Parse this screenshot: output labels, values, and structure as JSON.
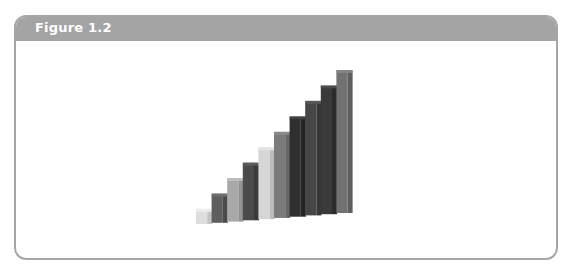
{
  "figure": {
    "title": "Figure 1.2",
    "header_color": "#a4a4a4",
    "border_color": "#a6a6a6"
  },
  "rods": [
    {
      "length": 1,
      "color": "#dedede",
      "side": "#c4c4c4",
      "top": "#ececec"
    },
    {
      "length": 2,
      "color": "#5e5e5e",
      "side": "#4a4a4a",
      "top": "#707070"
    },
    {
      "length": 3,
      "color": "#a9a9a9",
      "side": "#939393",
      "top": "#bcbcbc"
    },
    {
      "length": 4,
      "color": "#4b4b4b",
      "side": "#3a3a3a",
      "top": "#5c5c5c"
    },
    {
      "length": 5,
      "color": "#d6d6d6",
      "side": "#bdbdbd",
      "top": "#e4e4e4"
    },
    {
      "length": 6,
      "color": "#7b7b7b",
      "side": "#666666",
      "top": "#8c8c8c"
    },
    {
      "length": 7,
      "color": "#2f2f2f",
      "side": "#232323",
      "top": "#404040"
    },
    {
      "length": 8,
      "color": "#464646",
      "side": "#363636",
      "top": "#585858"
    },
    {
      "length": 9,
      "color": "#3a3a3a",
      "side": "#2b2b2b",
      "top": "#4b4b4b"
    },
    {
      "length": 10,
      "color": "#727272",
      "side": "#5e5e5e",
      "top": "#858585"
    }
  ]
}
